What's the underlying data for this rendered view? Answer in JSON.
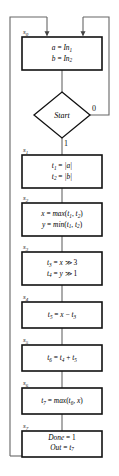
{
  "diagram": {
    "type": "flowchart",
    "start_decision": {
      "label": "Start",
      "branch_false_label": "0",
      "branch_true_label": "1"
    },
    "states": [
      {
        "id": "s0",
        "label": "s0",
        "label_text": "s",
        "label_sub": "0",
        "lines": [
          "a = In1",
          "b = In2"
        ],
        "line1": {
          "lhs": "a",
          "op": "=",
          "rhs": "In",
          "rhs_sub": "1"
        },
        "line2": {
          "lhs": "b",
          "op": "=",
          "rhs": "In",
          "rhs_sub": "2"
        }
      },
      {
        "id": "s1",
        "label": "s1",
        "label_text": "s",
        "label_sub": "1",
        "lines": [
          "t1 = |a|",
          "t2 = |b|"
        ],
        "line1": {
          "lhs": "t",
          "lhs_sub": "1",
          "op": "=",
          "rhs": "|a|"
        },
        "line2": {
          "lhs": "t",
          "lhs_sub": "2",
          "op": "=",
          "rhs": "|b|"
        }
      },
      {
        "id": "s2",
        "label": "s2",
        "label_text": "s",
        "label_sub": "2",
        "lines": [
          "x = max(t1, t2)",
          "y = min(t1, t2)"
        ],
        "line1": {
          "lhs": "x",
          "op": "=",
          "fn": "max",
          "arg1": "t",
          "arg1_sub": "1",
          "arg2": "t",
          "arg2_sub": "2"
        },
        "line2": {
          "lhs": "y",
          "op": "=",
          "fn": "min",
          "arg1": "t",
          "arg1_sub": "1",
          "arg2": "t",
          "arg2_sub": "2"
        }
      },
      {
        "id": "s3",
        "label": "s3",
        "label_text": "s",
        "label_sub": "3",
        "lines": [
          "t3 = x >> 3",
          "t4 = y >> 1"
        ],
        "line1": {
          "lhs": "t",
          "lhs_sub": "3",
          "op": "=",
          "var": "x",
          "shift": "≫",
          "amount": "3"
        },
        "line2": {
          "lhs": "t",
          "lhs_sub": "4",
          "op": "=",
          "var": "y",
          "shift": "≫",
          "amount": "1"
        }
      },
      {
        "id": "s4",
        "label": "s4",
        "label_text": "s",
        "label_sub": "4",
        "lines": [
          "t5 = x - t3"
        ],
        "line1": {
          "lhs": "t",
          "lhs_sub": "5",
          "op": "=",
          "a": "x",
          "minus": "−",
          "b": "t",
          "b_sub": "3"
        }
      },
      {
        "id": "s5",
        "label": "s5",
        "label_text": "s",
        "label_sub": "5",
        "lines": [
          "t6 = t4 + t5"
        ],
        "line1": {
          "lhs": "t",
          "lhs_sub": "6",
          "op": "=",
          "a": "t",
          "a_sub": "4",
          "plus": "+",
          "b": "t",
          "b_sub": "5"
        }
      },
      {
        "id": "s6",
        "label": "s6",
        "label_text": "s",
        "label_sub": "6",
        "lines": [
          "t7 = max(t6, x)"
        ],
        "line1": {
          "lhs": "t",
          "lhs_sub": "7",
          "op": "=",
          "fn": "max",
          "arg1": "t",
          "arg1_sub": "6",
          "arg2": "x"
        }
      },
      {
        "id": "s7",
        "label": "s7",
        "label_text": "s",
        "label_sub": "7",
        "lines": [
          "Done = 1",
          "Out = t7"
        ],
        "line1": {
          "lhs": "Done",
          "op": "=",
          "rhs": "1"
        },
        "line2": {
          "lhs": "Out",
          "op": "=",
          "rhs": "t",
          "rhs_sub": "7"
        }
      }
    ],
    "colors": {
      "box_stroke": "#111111",
      "line_stroke": "#555555",
      "text": "#000000",
      "background": "#ffffff"
    }
  }
}
